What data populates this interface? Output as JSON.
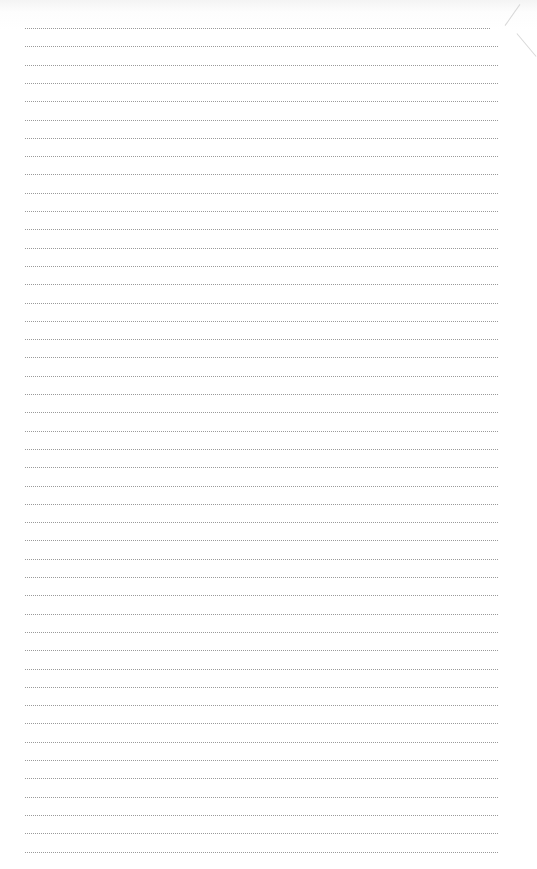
{
  "document": {
    "type": "blank dotted lined paper",
    "line_count": 46,
    "first_line_y": 28,
    "line_spacing": 18.3,
    "line_left": 25,
    "line_width": 473,
    "line_color": "#9a9a9a",
    "background": "#ffffff"
  }
}
